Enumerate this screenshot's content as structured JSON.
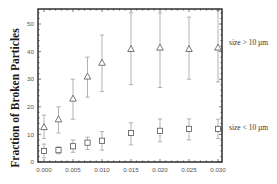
{
  "chart_data": {
    "type": "scatter",
    "title": "",
    "xlabel": "",
    "ylabel": "Fraction of Broken Particles",
    "xlim": [
      -0.001,
      0.0307
    ],
    "ylim": [
      0,
      55.6
    ],
    "xticks": [
      0.0,
      0.005,
      0.01,
      0.015,
      0.02,
      0.025,
      0.03
    ],
    "xtick_labels": [
      "0.000",
      "0.005",
      "0.010",
      "0.015",
      "0.020",
      "0.025",
      "0.030"
    ],
    "yticks": [
      0,
      10,
      20,
      30,
      40,
      50
    ],
    "ytick_labels": [
      "0",
      "10",
      "20",
      "30",
      "40",
      "50"
    ],
    "grid": false,
    "legend_position": "inline-right",
    "series": [
      {
        "name": "size > 10 µm",
        "marker": "triangle",
        "x": [
          0.0,
          0.0025,
          0.005,
          0.0075,
          0.01,
          0.015,
          0.02,
          0.025,
          0.03
        ],
        "values": [
          12.7,
          15.5,
          23,
          31,
          36,
          41,
          41.5,
          41,
          41.5
        ],
        "err_low": [
          8.5,
          10.5,
          15.5,
          23.5,
          25.5,
          28,
          27,
          30,
          29
        ],
        "err_high": [
          17,
          20,
          30,
          38,
          46,
          54,
          54,
          52.5,
          55
        ]
      },
      {
        "name": "size < 10 µm",
        "marker": "square",
        "x": [
          0.0,
          0.0025,
          0.005,
          0.0075,
          0.01,
          0.015,
          0.02,
          0.025,
          0.03
        ],
        "values": [
          4,
          4.3,
          5.7,
          7,
          7.7,
          10.5,
          11.3,
          12,
          12
        ],
        "err_low": [
          1.5,
          3,
          3.5,
          4.5,
          4.3,
          6.2,
          7.3,
          8,
          8.5
        ],
        "err_high": [
          6.5,
          5.5,
          8,
          9,
          11,
          14.2,
          15.6,
          15.6,
          15.5
        ]
      }
    ]
  },
  "colors": {
    "frame": "#222222",
    "marker": "#555555",
    "errorbar": "#aaaaaa",
    "text": "#333333"
  }
}
